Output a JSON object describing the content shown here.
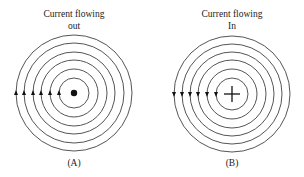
{
  "colors": {
    "line": "#555555",
    "ink": "#111111",
    "background": "#ffffff"
  },
  "panels": [
    {
      "id": "A",
      "title_line1": "Current flowing",
      "title_line2": "out",
      "label": "(A)",
      "center_symbol": "dot-icon",
      "arrow_direction": "up",
      "cx": 74,
      "cy": 93,
      "radii": [
        15,
        24,
        33,
        41,
        50,
        58
      ]
    },
    {
      "id": "B",
      "title_line1": "Current flowing",
      "title_line2": "In",
      "label": "(B)",
      "center_symbol": "cross-icon",
      "arrow_direction": "down",
      "cx": 232,
      "cy": 94,
      "radii": [
        16,
        25,
        34,
        42,
        50,
        58
      ]
    }
  ]
}
